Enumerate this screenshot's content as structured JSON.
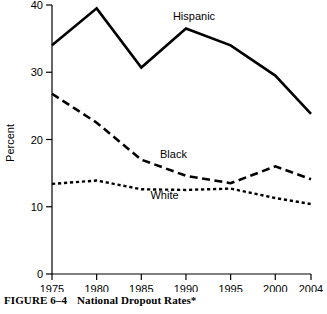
{
  "figure": {
    "caption_number": "FIGURE 6–4",
    "caption_title": "National Dropout Rates*"
  },
  "chart_data": {
    "type": "line",
    "title": "National Dropout Rates*",
    "xlabel": "",
    "ylabel": "Percent",
    "categories": [
      "1975",
      "1980",
      "1985",
      "1990",
      "1995",
      "2000",
      "2004"
    ],
    "x": [
      1975,
      1980,
      1985,
      1990,
      1995,
      2000,
      2004
    ],
    "xlim": [
      1975,
      2004
    ],
    "ylim": [
      0,
      40
    ],
    "yticks": [
      "0",
      "10",
      "20",
      "30",
      "40"
    ],
    "ytick_values": [
      0,
      10,
      20,
      30,
      40
    ],
    "xticks": [
      "1975",
      "1980",
      "1985",
      "1990",
      "1995",
      "2000",
      "2004"
    ],
    "grid": false,
    "legend_position": "inline-labels",
    "series": [
      {
        "name": "Hispanic",
        "style": "solid",
        "values": [
          34.0,
          39.5,
          30.7,
          36.5,
          34.0,
          29.5,
          23.8
        ],
        "label_x": 1990.9,
        "label_y": 37.8
      },
      {
        "name": "Black",
        "style": "long-dash",
        "values": [
          26.8,
          22.5,
          17.0,
          14.6,
          13.5,
          16.0,
          14.1
        ],
        "label_x": 1988.6,
        "label_y": 17.3
      },
      {
        "name": "White",
        "style": "short-dash",
        "values": [
          13.4,
          13.9,
          12.6,
          12.5,
          12.7,
          11.3,
          10.4
        ],
        "label_x": 1987.6,
        "label_y": 11.1
      }
    ]
  }
}
